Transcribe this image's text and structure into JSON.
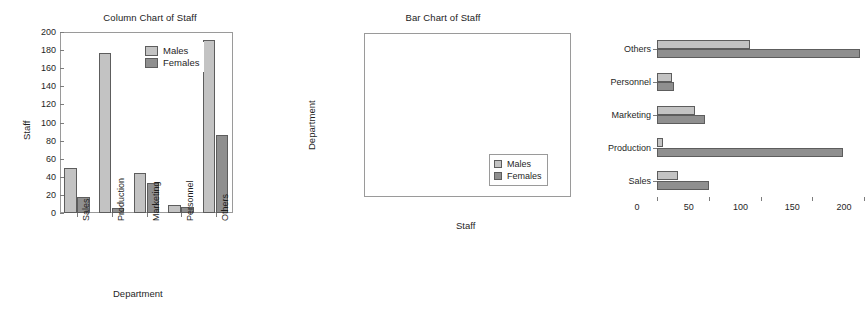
{
  "figure": {
    "background": "#ffffff",
    "series_colors": {
      "males": "#c3c3c3",
      "females": "#8f8f8f",
      "edge": "#5d5d5d"
    }
  },
  "legend": {
    "males_label": "Males",
    "females_label": "Females"
  },
  "chart_data": [
    {
      "type": "bar",
      "orientation": "vertical",
      "title": "Column Chart of Staff",
      "xlabel": "Department",
      "ylabel": "Staff",
      "categories": [
        "Sales",
        "Production",
        "Marketing",
        "Personnel",
        "Others"
      ],
      "category_label_rotation": 90,
      "ylim": [
        0,
        200
      ],
      "yticks": [
        0,
        20,
        40,
        60,
        80,
        100,
        120,
        140,
        160,
        180,
        200
      ],
      "grid": false,
      "legend_position": "upper center",
      "series": [
        {
          "name": "Males",
          "color": "#c3c3c3",
          "values": [
            50,
            177,
            44,
            9,
            191
          ]
        },
        {
          "name": "Females",
          "color": "#8f8f8f",
          "values": [
            18,
            6,
            33,
            7,
            86
          ]
        }
      ]
    },
    {
      "type": "bar",
      "orientation": "horizontal",
      "title": "Bar Chart of Staff",
      "xlabel": "Staff",
      "ylabel": "Department",
      "categories": [
        "Others",
        "Personnel",
        "Marketing",
        "Production",
        "Sales"
      ],
      "xlim": [
        0,
        200
      ],
      "xticks": [
        0,
        50,
        100,
        150,
        200
      ],
      "grid": false,
      "legend_position": "lower right",
      "series": [
        {
          "name": "Males",
          "color": "#c3c3c3",
          "values": [
            90,
            14,
            37,
            6,
            20
          ]
        },
        {
          "name": "Females",
          "color": "#8f8f8f",
          "values": [
            196,
            16,
            46,
            180,
            50
          ]
        }
      ]
    }
  ]
}
